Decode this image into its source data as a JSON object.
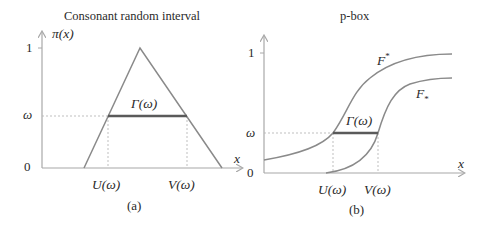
{
  "colors": {
    "axis": "#a8a8a8",
    "curve": "#8a8a8a",
    "interval": "#5a5a5a",
    "guide": "#b8b8b8",
    "text": "#2a2a2a"
  },
  "panel_a": {
    "title": "Consonant random interval",
    "y_axis_label": "π(x)",
    "x_axis_label": "x",
    "y_ticks": [
      "1",
      "ω",
      "0"
    ],
    "interval_label": "Γ(ω)",
    "x_markers": [
      "U(ω)",
      "V(ω)"
    ],
    "caption": "(a)"
  },
  "panel_b": {
    "title": "p-box",
    "x_axis_label": "x",
    "y_ticks": [
      "1",
      "ω",
      "0"
    ],
    "upper_curve_label": "F*",
    "lower_curve_label": "F•",
    "upper_curve_base": "F",
    "upper_curve_sup": "*",
    "lower_curve_base": "F",
    "lower_curve_sub": "*",
    "interval_label": "Γ(ω)",
    "x_markers": [
      "U(ω)",
      "V(ω)"
    ],
    "caption": "(b)"
  }
}
